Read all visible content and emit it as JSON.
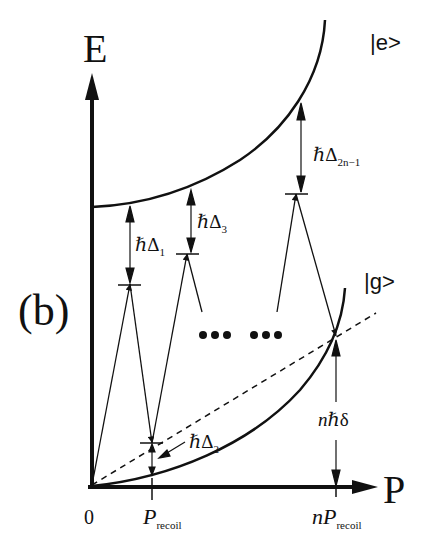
{
  "figure": {
    "panel_label": "(b)",
    "axes": {
      "y_label": "E",
      "x_label": "P",
      "origin_label": "0",
      "x_ticks": [
        {
          "main": "P",
          "sub": "recoil"
        },
        {
          "prefix": "n",
          "main": "P",
          "sub": "recoil"
        }
      ]
    },
    "states": {
      "excited": "|e>",
      "ground": "|g>"
    },
    "detunings": [
      {
        "hbar": "ℏ",
        "symbol": "Δ",
        "sub": "1"
      },
      {
        "hbar": "ℏ",
        "symbol": "Δ",
        "sub": "2"
      },
      {
        "hbar": "ℏ",
        "symbol": "Δ",
        "sub": "3"
      },
      {
        "hbar": "ℏ",
        "symbol": "Δ",
        "sub": "2n−1"
      }
    ],
    "final_offset": {
      "prefix": "n",
      "hbar": "ℏ",
      "symbol": "δ"
    },
    "ellipsis": "••• •••",
    "colors": {
      "ink": "#111111",
      "background": "#ffffff"
    }
  }
}
